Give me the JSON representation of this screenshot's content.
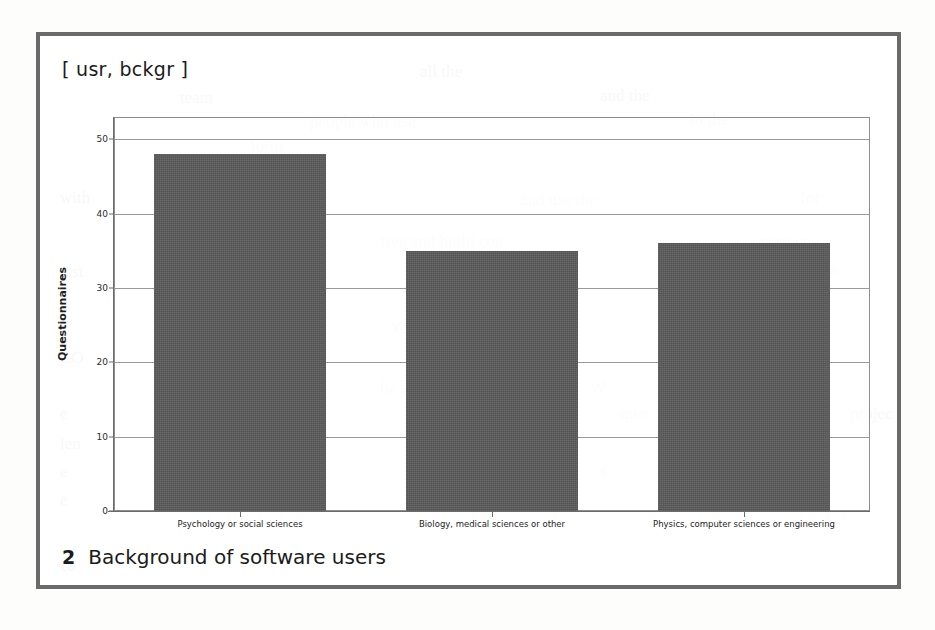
{
  "figure": {
    "title": "[ usr, bckgr ]",
    "caption_number": "2",
    "caption_text": "Background of software users"
  },
  "chart_data": {
    "type": "bar",
    "title": "[ usr, bckgr ]",
    "xlabel": "",
    "ylabel": "Questionnaires",
    "ylim": [
      0,
      53
    ],
    "yticks": [
      0,
      10,
      20,
      30,
      40,
      50
    ],
    "ytick_labels": [
      "0",
      "10",
      "20",
      "30",
      "40",
      "50"
    ],
    "grid": true,
    "legend": "none",
    "categories": [
      "Psychology or social sciences",
      "Biology, medical sciences or other",
      "Physics, computer sciences or engineering"
    ],
    "values": [
      48,
      35,
      36
    ],
    "bar_color": "#5b5b5b",
    "axis_color": "#6b6b6b",
    "gridline_color": "#9a9a9a"
  },
  "colors": {
    "frame_border": "#6a6a6a",
    "page_background": "#fdfdfc",
    "text": "#1b1b1b",
    "bleed_through": "#dedad6"
  },
  "bleed_text": {
    "l01": "all the",
    "l02": "team",
    "l03": "and the",
    "l04": "people who use",
    "l05": "in the",
    "l06": "form",
    "l07": "with",
    "l08": "and use the",
    "l09": "for",
    "l10": "five and build con",
    "l11": "very co",
    "l12": "test",
    "l13": "on the",
    "l14": "e",
    "l15": "e",
    "l16": "Your",
    "l17": "propos",
    "l18": "he pe",
    "l19": "CO",
    "l20": "be le",
    "l21": "W",
    "l22": "we",
    "l23": "e",
    "l24": "the",
    "l25": "quar",
    "l26": "g",
    "l27": "projec",
    "l28": "len",
    "l29": "e",
    "l30": "Que",
    "l31": "s",
    "l32": "the",
    "l33": "e",
    "l34": "effo",
    "l35": "on",
    "l36": "co"
  }
}
